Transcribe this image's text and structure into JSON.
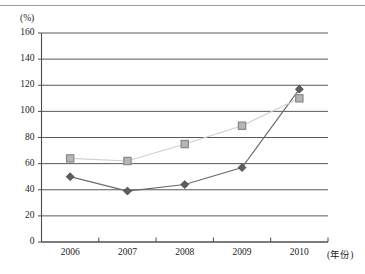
{
  "chart_data": {
    "type": "line",
    "title": "",
    "subtitle": "",
    "xlabel": "(年份)",
    "ylabel": "(%)",
    "categories": [
      "2006",
      "2007",
      "2008",
      "2009",
      "2010"
    ],
    "x": [
      2006,
      2007,
      2008,
      2009,
      2010
    ],
    "series": [
      {
        "name": "series-diamond",
        "marker": "diamond",
        "color": "#595959",
        "line_color": "#6b6b6b",
        "values": [
          50,
          39,
          44,
          57,
          117
        ]
      },
      {
        "name": "series-square",
        "marker": "square",
        "color": "#b3b3b3",
        "line_color": "#cfcfcf",
        "values": [
          64,
          62,
          75,
          89,
          110
        ]
      }
    ],
    "ylim": [
      0,
      160
    ],
    "yticks": [
      0,
      20,
      40,
      60,
      80,
      100,
      120,
      140,
      160
    ],
    "ytick_labels": [
      "0",
      "20",
      "40",
      "60",
      "80",
      "100",
      "120",
      "140",
      "160"
    ],
    "xtick_labels": [
      "2006",
      "2007",
      "2008",
      "2009",
      "2010"
    ],
    "grid": "horizontal",
    "legend": "none",
    "axis_color": "#4d4d4d",
    "grid_color": "#5a5a5a",
    "text_color": "#1c1c1c"
  },
  "figure": {
    "top_rule_color": "#9a9a9a",
    "background": "#ffffff"
  }
}
